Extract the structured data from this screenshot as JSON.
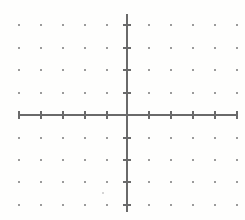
{
  "figure": {
    "title": "",
    "background_color": "#fefefd",
    "width": 245,
    "height": 220
  },
  "chart_data": {
    "type": "scatter",
    "title": "",
    "subtitle": "",
    "xlabel": "",
    "ylabel": "",
    "grid": "dots",
    "legend": "none",
    "axis_labels_visible": false,
    "tick_labels_visible": false,
    "xlim": [
      -5,
      5
    ],
    "ylim": [
      -4,
      4
    ],
    "x_ticks": [
      -5,
      -4,
      -3,
      -2,
      -1,
      1,
      2,
      3,
      4,
      5
    ],
    "y_ticks": [
      -4,
      -3,
      -2,
      -1,
      1,
      2,
      3,
      4
    ],
    "x_tick_labels": [],
    "y_tick_labels": [],
    "series": [],
    "values": [],
    "categories": [],
    "annotations": []
  },
  "geometry": {
    "origin": {
      "x": 127,
      "y": 115
    },
    "spacing": {
      "x": 22,
      "y": 22.5
    },
    "x_axis": {
      "start_px": 19,
      "end_px": 238,
      "y_px": 115
    },
    "y_axis": {
      "start_px": 14,
      "end_px": 212,
      "x_px": 127
    },
    "dot_columns_px": [
      19,
      41,
      63,
      85,
      107,
      149,
      171,
      193,
      215,
      237
    ],
    "dot_rows_px": [
      25,
      48,
      70,
      93,
      138,
      160,
      182,
      205
    ],
    "x_tick_positions_px": [
      19,
      41,
      63,
      85,
      107,
      149,
      171,
      193,
      215,
      237
    ],
    "y_tick_positions_px": [
      25,
      48,
      70,
      93,
      138,
      160,
      182,
      205
    ],
    "tick_half_length_px": 4,
    "dot_size_px": 1.6,
    "stray_marks_px": [
      {
        "x": 103,
        "y": 193,
        "size": 1.1,
        "opacity": 0.35
      }
    ]
  },
  "style": {
    "axis_color": "#6a6a6a",
    "axis_width": 1.1,
    "tick_color": "#6a6a6a",
    "tick_width": 1.1,
    "dot_color": "#8a8a8a",
    "dot_opacity": 0.85,
    "paper_color": "#fefefd"
  }
}
